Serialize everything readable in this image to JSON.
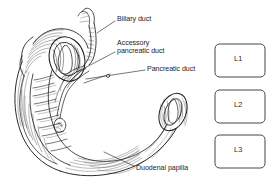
{
  "figure": {
    "style": "pen-and-ink line drawing, black on white",
    "background_color": "#ffffff",
    "ink_color": "#1d1d1d"
  },
  "annotations": [
    {
      "id": "biliary-duct",
      "text": "Biliary duct",
      "lines": [
        "Biliary duct"
      ],
      "text_x": 117,
      "text_y": 14.5,
      "leader": {
        "from_x": 115,
        "from_y": 21,
        "to_x": 97,
        "to_y": 33
      }
    },
    {
      "id": "accessory-pancreatic-duct",
      "text": "Accessory pancreatic duct",
      "lines": [
        "Accessory",
        "pancreatic duct"
      ],
      "text_x": 117,
      "text_y": 38.5,
      "leader": {
        "from_x": 115,
        "from_y": 52,
        "to_x": 76,
        "to_y": 72
      }
    },
    {
      "id": "pancreatic-duct",
      "text": "Pancreatic duct",
      "lines": [
        "Pancreatic duct"
      ],
      "text_x": 147,
      "text_y": 64.5,
      "leader": {
        "from_x": 145,
        "from_y": 70,
        "to_x": 84,
        "to_y": 80
      }
    },
    {
      "id": "duodenal-papilla",
      "text": "Duodenal papilla",
      "lines": [
        "Duodenal papilla"
      ],
      "text_x": 136,
      "text_y": 164,
      "leader": {
        "from_x": 134,
        "from_y": 166,
        "to_x": 103,
        "to_y": 152
      }
    }
  ],
  "vertebrae": {
    "shape": "rounded-rectangle",
    "outline_color": "#3a3a3a",
    "fill_color": "#ffffff",
    "items": [
      {
        "id": "l1",
        "label": "L1",
        "x": 215,
        "y": 44,
        "width": 50,
        "height": 33
      },
      {
        "id": "l2",
        "label": "L2",
        "x": 215,
        "y": 90,
        "width": 50,
        "height": 33
      },
      {
        "id": "l3",
        "label": "L3",
        "x": 215,
        "y": 135,
        "width": 50,
        "height": 33
      }
    ]
  },
  "anatomy": {
    "structures": [
      "duodenum",
      "superior duodenal cross-section",
      "descending duodenum with circular folds",
      "horizontal duodenum",
      "distal duodenal cross-section",
      "common bile duct",
      "main pancreatic duct",
      "accessory pancreatic duct",
      "major duodenal papilla"
    ]
  }
}
